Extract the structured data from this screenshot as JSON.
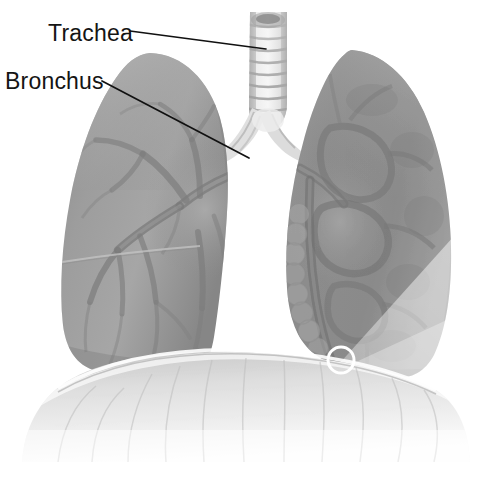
{
  "figure": {
    "width": 490,
    "height": 486,
    "background_color": "#ffffff",
    "style": "grayscale medical illustration"
  },
  "annotations": [
    {
      "id": "trachea",
      "label": "Trachea",
      "label_x": 48,
      "label_y": 41,
      "leader_from_x": 130,
      "leader_from_y": 31,
      "leader_to_x": 266,
      "leader_to_y": 49,
      "line_color": "#111111",
      "text_color": "#141414"
    },
    {
      "id": "bronchus",
      "label": "Bronchus",
      "label_x": 5,
      "label_y": 89,
      "leader_from_x": 102,
      "leader_from_y": 81,
      "leader_to_x": 249,
      "leader_to_y": 158,
      "line_color": "#111111",
      "text_color": "#141414"
    }
  ],
  "structures": {
    "trachea": {
      "name": "trachea",
      "x": 248,
      "y": 14,
      "width": 40,
      "height": 112,
      "ring_count": 9,
      "fill_color": "#e8e8e8"
    },
    "left_lung": {
      "name": "left lung",
      "x": 62,
      "y": 52,
      "width": 166,
      "height": 326,
      "fill_color": "#9a9a9a"
    },
    "right_lung": {
      "name": "right lung",
      "x": 285,
      "y": 48,
      "width": 167,
      "height": 330,
      "fill_color": "#949494"
    },
    "diaphragm": {
      "name": "diaphragm",
      "x": 22,
      "y": 362,
      "width": 448,
      "height": 100,
      "fill_color": "#d8d8d8"
    }
  },
  "markers": {
    "focus_circle": {
      "name": "focus circle marker",
      "center_x": 341,
      "center_y": 360,
      "radius": 13,
      "stroke_color": "#ffffff",
      "stroke_width": 3
    },
    "beam_wedge": {
      "name": "translucent wedge overlay",
      "apex_x": 330,
      "apex_y": 372,
      "fill_color": "#ffffff",
      "opacity": 0.42
    }
  },
  "palette": {
    "background": "#ffffff",
    "lung_mid": "#9a9a9a",
    "lung_dark": "#7c7c7c",
    "lung_light": "#bdbdbd",
    "airway_light": "#e8e8e8",
    "diaphragm": "#d8d8d8",
    "label_text": "#141414",
    "leader_line": "#111111",
    "marker_stroke": "#ffffff"
  }
}
